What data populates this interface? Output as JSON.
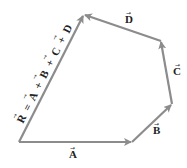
{
  "diagram": {
    "type": "vector-addition-polygon",
    "line_color": "#8c8c8c",
    "vertices": {
      "origin": [
        19,
        142
      ],
      "after_A": [
        132,
        142
      ],
      "after_B": [
        172,
        104
      ],
      "after_C": [
        161,
        41
      ],
      "after_D": [
        84,
        15
      ]
    },
    "vectors": [
      {
        "name": "A",
        "label": "A",
        "from": "origin",
        "to": "after_A"
      },
      {
        "name": "B",
        "label": "B",
        "from": "after_A",
        "to": "after_B"
      },
      {
        "name": "C",
        "label": "C",
        "from": "after_B",
        "to": "after_C"
      },
      {
        "name": "D",
        "label": "D",
        "from": "after_C",
        "to": "after_D"
      },
      {
        "name": "R",
        "label": "R",
        "from": "origin",
        "to": "after_D"
      }
    ],
    "resultant_equation": {
      "R": "R",
      "eq": "=",
      "A": "A",
      "plus1": "+",
      "B": "B",
      "plus2": "+",
      "C": "C",
      "plus3": "+",
      "D": "D"
    },
    "arrow_glyph": "→"
  }
}
